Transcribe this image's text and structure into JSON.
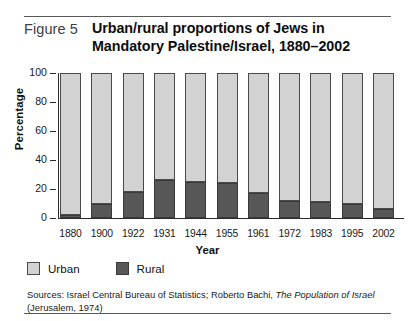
{
  "figure": {
    "label": "Figure 5",
    "title_line1": "Urban/rural proportions of Jews in",
    "title_line2": "Mandatory Palestine/Israel, 1880–2002"
  },
  "legend": {
    "urban_label": "Urban",
    "rural_label": "Rural"
  },
  "sources": {
    "prefix": "Sources: Israel Central Bureau of Statistics; Roberto Bachi, ",
    "italic_title": "The Population of Israel",
    "suffix": " (Jerusalem, 1974)"
  },
  "colors": {
    "urban": "#d2d2d2",
    "rural": "#575757",
    "outline": "#4a4a4a",
    "rule": "#5a5a5a"
  },
  "chart_data": {
    "type": "bar",
    "stacked": true,
    "title": "Urban/rural proportions of Jews in Mandatory Palestine/Israel, 1880–2002",
    "xlabel": "Year",
    "ylabel": "Percentage",
    "ylim": [
      0,
      100
    ],
    "yticks": [
      0,
      20,
      40,
      60,
      80,
      100
    ],
    "ytick_labels": [
      "0",
      "20",
      "40",
      "60",
      "80",
      "100"
    ],
    "grid": false,
    "legend_position": "below-axis-left",
    "categories": [
      "1880",
      "1900",
      "1922",
      "1931",
      "1944",
      "1955",
      "1961",
      "1972",
      "1983",
      "1995",
      "2002"
    ],
    "series": [
      {
        "name": "Urban",
        "color": "#d2d2d2",
        "values": [
          98,
          90,
          82,
          74,
          75,
          76,
          83,
          88,
          89,
          90,
          94
        ]
      },
      {
        "name": "Rural",
        "color": "#575757",
        "values": [
          2,
          10,
          18,
          26,
          25,
          24,
          17,
          12,
          11,
          10,
          6
        ]
      }
    ]
  }
}
